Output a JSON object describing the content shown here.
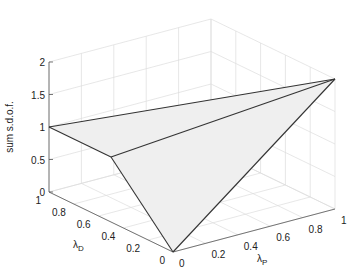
{
  "chart_data": {
    "type": "surface3d",
    "title": "",
    "xlabel": "λP",
    "ylabel": "λD",
    "zlabel": "sum s.d.o.f.",
    "xlabel_main": "λ",
    "xlabel_sub": "P",
    "ylabel_main": "λ",
    "ylabel_sub": "D",
    "xlim": [
      0,
      1
    ],
    "ylim": [
      0,
      1
    ],
    "zlim": [
      0,
      2
    ],
    "xticks": [
      "0",
      "0.2",
      "0.4",
      "0.6",
      "0.8",
      "1"
    ],
    "yticks": [
      "0",
      "0.2",
      "0.4",
      "0.6",
      "0.8",
      "1"
    ],
    "zticks": [
      "0",
      "0.5",
      "1",
      "1.5",
      "2"
    ],
    "xtick_values": [
      0,
      0.2,
      0.4,
      0.6,
      0.8,
      1
    ],
    "ytick_values": [
      0,
      0.2,
      0.4,
      0.6,
      0.8,
      1
    ],
    "ztick_values": [
      0,
      0.5,
      1,
      1.5,
      2
    ],
    "grid": true,
    "vertices": [
      {
        "name": "A",
        "lambdaP": 0,
        "lambdaD": 1,
        "z": 1
      },
      {
        "name": "M",
        "lambdaP": 0,
        "lambdaD": 0.5,
        "z": 1
      },
      {
        "name": "B",
        "lambdaP": 0,
        "lambdaD": 0,
        "z": 0
      },
      {
        "name": "C",
        "lambdaP": 1,
        "lambdaD": 0,
        "z": 2
      }
    ],
    "faces": [
      [
        "A",
        "M",
        "C"
      ],
      [
        "M",
        "B",
        "C"
      ]
    ],
    "edges": [
      [
        "A",
        "C"
      ],
      [
        "A",
        "M"
      ],
      [
        "M",
        "B"
      ],
      [
        "B",
        "C"
      ],
      [
        "M",
        "C"
      ]
    ],
    "colors": {
      "surface": "#efefef",
      "edge": "#333333",
      "grid": "#dcdcdc",
      "axis": "#555555"
    }
  }
}
